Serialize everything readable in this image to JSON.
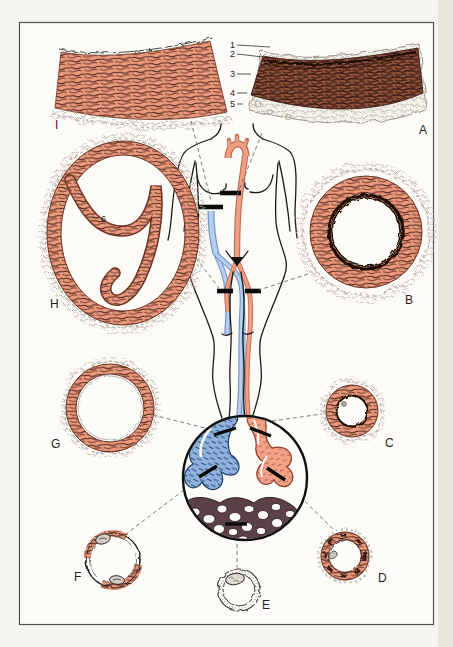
{
  "plate": {
    "section_letters": {
      "i": "I",
      "a": "A",
      "h": "H",
      "b": "B",
      "g": "G",
      "c": "C",
      "f": "F",
      "e": "E",
      "d": "D"
    },
    "layer_numbers": {
      "n1": "1",
      "n2": "2",
      "n3": "3",
      "n4": "4",
      "n5": "5",
      "n6": "6"
    },
    "colors": {
      "salmon_muscle": "#ec9a7d",
      "dark_elastic_media": "#96543e",
      "vein_blue": "#8fb2dc",
      "body_vein_blue": "#b7cfec",
      "artery_pink": "#f2a287",
      "capillary_brown": "#5a4147",
      "paper": "#f7f5f1",
      "outline_ink": "#1a1a1a"
    }
  }
}
